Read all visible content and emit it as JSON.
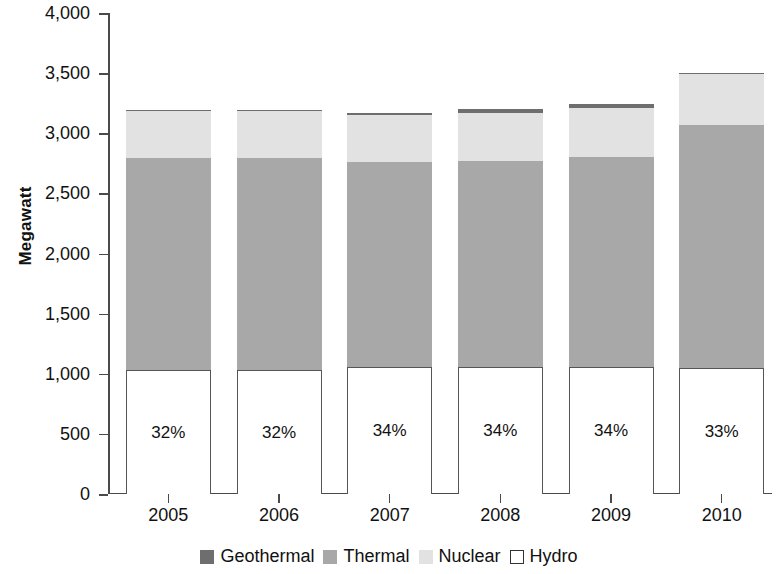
{
  "chart_data": {
    "type": "bar",
    "stacked": true,
    "title": "",
    "subtitle": "",
    "xlabel": "",
    "ylabel": "Megawatt",
    "categories": [
      "2005",
      "2006",
      "2007",
      "2008",
      "2009",
      "2010"
    ],
    "ylim": [
      0,
      4000
    ],
    "yticks": [
      0,
      500,
      1000,
      1500,
      2000,
      2500,
      3000,
      3500,
      4000
    ],
    "ytick_labels": [
      "0",
      "500",
      "1,000",
      "1,500",
      "2,000",
      "2,500",
      "3,000",
      "3,500",
      "4,000"
    ],
    "grid": false,
    "legend_position": "bottom",
    "stack_order_bottom_to_top": [
      "Hydro",
      "Thermal",
      "Nuclear",
      "Geothermal"
    ],
    "series": [
      {
        "name": "Geothermal",
        "color": "#6e6e6e",
        "values": [
          10,
          10,
          10,
          30,
          30,
          10
        ]
      },
      {
        "name": "Thermal",
        "color": "#a8a8a8",
        "values": [
          1765,
          1765,
          1705,
          1710,
          1740,
          2020
        ]
      },
      {
        "name": "Nuclear",
        "color": "#e2e2e2",
        "values": [
          390,
          390,
          390,
          400,
          410,
          420
        ]
      },
      {
        "name": "Hydro",
        "color": "#ffffff",
        "values": [
          1030,
          1030,
          1060,
          1060,
          1060,
          1050
        ]
      }
    ],
    "totals": [
      3195,
      3195,
      3165,
      3200,
      3240,
      3500
    ],
    "data_labels": {
      "series": "Hydro",
      "values": [
        "32%",
        "32%",
        "34%",
        "34%",
        "34%",
        "33%"
      ]
    }
  },
  "legend": {
    "items": [
      {
        "label": "Geothermal",
        "swatch": "geothermal"
      },
      {
        "label": "Thermal",
        "swatch": "thermal"
      },
      {
        "label": "Nuclear",
        "swatch": "nuclear"
      },
      {
        "label": "Hydro",
        "swatch": "hydro"
      }
    ]
  }
}
